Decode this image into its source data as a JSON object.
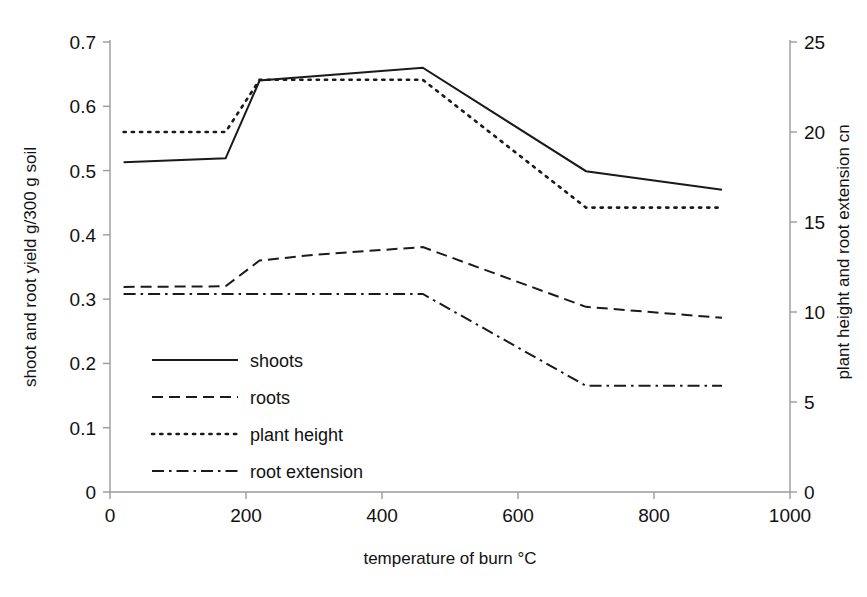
{
  "chart_data": {
    "type": "line",
    "title": "",
    "xlabel": "temperature of burn  °C",
    "ylabel": "shoot and root yield  g/300 g soil",
    "y2label": "plant height and root extension  cn",
    "xlim": [
      0,
      1000
    ],
    "ylim": [
      0,
      0.7
    ],
    "y2lim": [
      0,
      25
    ],
    "grid": false,
    "legend_position": "inside-lower-left",
    "xticks": [
      0,
      200,
      400,
      600,
      800,
      1000
    ],
    "xtick_labels": [
      "0",
      "200",
      "400",
      "600",
      "800",
      "1000"
    ],
    "yticks": [
      0,
      0.1,
      0.2,
      0.3,
      0.4,
      0.5,
      0.6,
      0.7
    ],
    "ytick_labels": [
      "0",
      "0.1",
      "0.2",
      "0.3",
      "0.4",
      "0.5",
      "0.6",
      "0.7"
    ],
    "y2ticks": [
      0,
      5,
      10,
      15,
      20,
      25
    ],
    "y2tick_labels": [
      "0",
      "5",
      "10",
      "15",
      "20",
      "25"
    ],
    "series": [
      {
        "name": "shoots",
        "axis": "left",
        "dash": "solid",
        "x": [
          20,
          170,
          220,
          460,
          700,
          900
        ],
        "values": [
          0.513,
          0.519,
          0.64,
          0.66,
          0.499,
          0.47
        ]
      },
      {
        "name": "roots",
        "axis": "left",
        "dash": "dashed",
        "x": [
          20,
          170,
          220,
          300,
          460,
          700,
          900
        ],
        "values": [
          0.319,
          0.32,
          0.36,
          0.369,
          0.381,
          0.288,
          0.271
        ]
      },
      {
        "name": "plant height",
        "axis": "right",
        "dash": "dotted",
        "x": [
          20,
          170,
          220,
          460,
          700,
          900
        ],
        "values": [
          20.0,
          20.0,
          22.9,
          22.9,
          15.8,
          15.8
        ]
      },
      {
        "name": "root extension",
        "axis": "right",
        "dash": "dashdot",
        "x": [
          20,
          170,
          220,
          460,
          700,
          900
        ],
        "values": [
          11.0,
          11.0,
          11.0,
          11.0,
          5.9,
          5.9
        ]
      }
    ]
  },
  "legend": {
    "items": [
      {
        "label": "shoots",
        "style": "solid"
      },
      {
        "label": "roots",
        "style": "dashed"
      },
      {
        "label": "plant height",
        "style": "dotted"
      },
      {
        "label": "root extension",
        "style": "dashdot"
      }
    ]
  },
  "axes": {
    "left_title": "shoot and root yield  g/300 g soil",
    "right_title": "plant height and root extension  cn",
    "bottom_title": "temperature of burn  °C"
  },
  "colors": {
    "ink": "#1a1a1a",
    "axis": "#9a9a9a",
    "background": "#ffffff"
  }
}
